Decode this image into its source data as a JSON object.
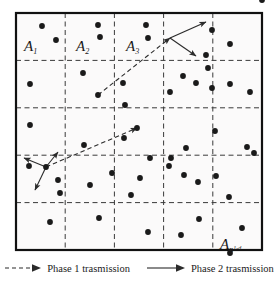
{
  "figure": {
    "border_color": "#111111",
    "grid_line_color": "#3a3a3a",
    "dot_color": "#1a1a1a",
    "arrow_color": "#2b2b2b",
    "background": "#fbfafa",
    "grid": {
      "rows": 5,
      "cols": 5,
      "x0": 16,
      "y0": 13,
      "x1": 262,
      "y1": 250
    },
    "cell_labels": [
      {
        "name": "cell-label-a1",
        "base": "A",
        "sub": "1",
        "sup": "",
        "x": 24,
        "y": 38
      },
      {
        "name": "cell-label-a2",
        "base": "A",
        "sub": "2",
        "sup": "",
        "x": 76,
        "y": 38
      },
      {
        "name": "cell-label-a3",
        "base": "A",
        "sub": "3",
        "sup": "",
        "x": 126,
        "y": 38
      },
      {
        "name": "cell-label-an",
        "base": "A",
        "sub": "n",
        "sup": "1-d",
        "x": 220,
        "y": 236
      }
    ],
    "dots": [
      [
        42,
        26
      ],
      [
        98,
        25
      ],
      [
        146,
        25
      ],
      [
        262,
        0
      ],
      [
        56,
        40
      ],
      [
        100,
        37
      ],
      [
        148,
        38
      ],
      [
        230,
        44
      ],
      [
        212,
        30
      ],
      [
        206,
        55
      ],
      [
        30,
        84
      ],
      [
        83,
        73
      ],
      [
        98,
        95
      ],
      [
        123,
        83
      ],
      [
        125,
        105
      ],
      [
        170,
        92
      ],
      [
        183,
        76
      ],
      [
        196,
        83
      ],
      [
        208,
        68
      ],
      [
        212,
        88
      ],
      [
        230,
        84
      ],
      [
        250,
        92
      ],
      [
        30,
        125
      ],
      [
        84,
        145
      ],
      [
        124,
        138
      ],
      [
        137,
        128
      ],
      [
        150,
        158
      ],
      [
        171,
        158
      ],
      [
        186,
        148
      ],
      [
        215,
        131
      ],
      [
        247,
        147
      ],
      [
        29,
        166
      ],
      [
        46,
        167
      ],
      [
        58,
        180
      ],
      [
        60,
        193
      ],
      [
        90,
        185
      ],
      [
        112,
        173
      ],
      [
        131,
        195
      ],
      [
        140,
        178
      ],
      [
        169,
        166
      ],
      [
        184,
        175
      ],
      [
        198,
        182
      ],
      [
        216,
        176
      ],
      [
        229,
        197
      ],
      [
        254,
        153
      ],
      [
        50,
        222
      ],
      [
        99,
        218
      ],
      [
        148,
        232
      ],
      [
        181,
        235
      ],
      [
        199,
        219
      ],
      [
        242,
        228
      ],
      [
        230,
        253
      ]
    ],
    "phase1_edges": [
      {
        "name": "phase1-edge-upper",
        "x1": 98,
        "y1": 95,
        "x2": 170,
        "y2": 38
      },
      {
        "name": "phase1-edge-lower",
        "x1": 46,
        "y1": 167,
        "x2": 137,
        "y2": 128
      }
    ],
    "phase2_edges": [
      {
        "name": "phase2-edge-top-right-a",
        "x1": 170,
        "y1": 38,
        "x2": 206,
        "y2": 22
      },
      {
        "name": "phase2-edge-top-right-b",
        "x1": 170,
        "y1": 38,
        "x2": 196,
        "y2": 56
      },
      {
        "name": "phase2-edge-bottom-left-a",
        "x1": 46,
        "y1": 167,
        "x2": 24,
        "y2": 158
      },
      {
        "name": "phase2-edge-bottom-left-b",
        "x1": 46,
        "y1": 167,
        "x2": 58,
        "y2": 152
      },
      {
        "name": "phase2-edge-bottom-left-c",
        "x1": 46,
        "y1": 167,
        "x2": 35,
        "y2": 190
      }
    ]
  },
  "legend": {
    "phase1_label": "Phase 1 trasmission",
    "phase2_label": "Phase 2 trasmission",
    "phase1_style": "dashed-arrow",
    "phase2_style": "solid-arrow"
  }
}
